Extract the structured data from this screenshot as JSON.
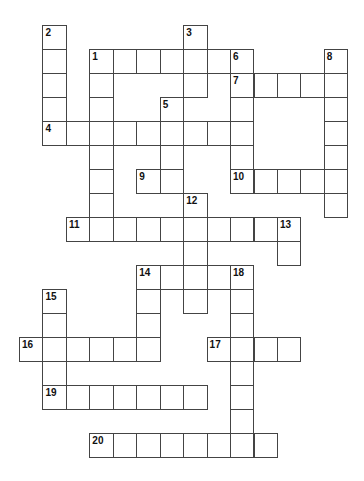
{
  "puzzle": {
    "origin_x": 19,
    "origin_y": 25,
    "cell_w": 23.45,
    "cell_h": 24.0,
    "words": [
      {
        "number": "1",
        "dir": "across",
        "row": 1,
        "col": 3,
        "length": 7
      },
      {
        "number": "1",
        "dir": "down",
        "row": 1,
        "col": 3,
        "length": 8
      },
      {
        "number": "2",
        "dir": "down",
        "row": 0,
        "col": 1,
        "length": 5
      },
      {
        "number": "3",
        "dir": "down",
        "row": 0,
        "col": 7,
        "length": 3
      },
      {
        "number": "4",
        "dir": "across",
        "row": 4,
        "col": 1,
        "length": 9
      },
      {
        "number": "5",
        "dir": "down",
        "row": 3,
        "col": 6,
        "length": 4
      },
      {
        "number": "6",
        "dir": "down",
        "row": 1,
        "col": 9,
        "length": 6
      },
      {
        "number": "7",
        "dir": "across",
        "row": 2,
        "col": 9,
        "length": 5
      },
      {
        "number": "8",
        "dir": "down",
        "row": 1,
        "col": 13,
        "length": 7
      },
      {
        "number": "9",
        "dir": "across",
        "row": 6,
        "col": 5,
        "length": 2
      },
      {
        "number": "10",
        "dir": "across",
        "row": 6,
        "col": 9,
        "length": 5
      },
      {
        "number": "11",
        "dir": "across",
        "row": 8,
        "col": 2,
        "length": 10
      },
      {
        "number": "12",
        "dir": "down",
        "row": 7,
        "col": 7,
        "length": 5
      },
      {
        "number": "13",
        "dir": "down",
        "row": 8,
        "col": 11,
        "length": 2
      },
      {
        "number": "14",
        "dir": "across",
        "row": 10,
        "col": 5,
        "length": 5
      },
      {
        "number": "14",
        "dir": "down",
        "row": 10,
        "col": 5,
        "length": 4
      },
      {
        "number": "15",
        "dir": "down",
        "row": 11,
        "col": 1,
        "length": 5
      },
      {
        "number": "16",
        "dir": "across",
        "row": 13,
        "col": 0,
        "length": 6
      },
      {
        "number": "17",
        "dir": "across",
        "row": 13,
        "col": 8,
        "length": 4
      },
      {
        "number": "18",
        "dir": "down",
        "row": 10,
        "col": 9,
        "length": 8
      },
      {
        "number": "19",
        "dir": "across",
        "row": 15,
        "col": 1,
        "length": 7
      },
      {
        "number": "20",
        "dir": "across",
        "row": 17,
        "col": 3,
        "length": 8
      }
    ]
  }
}
